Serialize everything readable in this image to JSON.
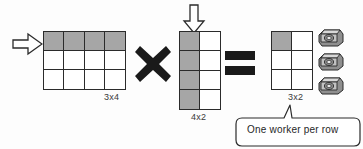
{
  "diagram": {
    "background_color": "#fdfdfd",
    "shade_color": "#a6a6a6",
    "line_color": "#2b2b2b"
  },
  "matrix_a": {
    "label": "3x4",
    "rows": 3,
    "cols": 4,
    "shaded_cells": "top row",
    "arrow_icon": "arrow-right-icon"
  },
  "matrix_b": {
    "label": "4x2",
    "rows": 4,
    "cols": 2,
    "shaded_cells": "left column",
    "arrow_icon": "arrow-down-icon"
  },
  "matrix_c": {
    "label": "3x2",
    "rows": 3,
    "cols": 2,
    "shaded_cells": "top-left cell"
  },
  "operators": {
    "multiply": "×",
    "multiply_icon": "multiply-icon",
    "equals": "=",
    "equals_icon": "equals-icon"
  },
  "workers": {
    "count": 3,
    "icon": "processor-chip-icon"
  },
  "callout": {
    "text": "One worker per row",
    "pointer": "up-right"
  }
}
